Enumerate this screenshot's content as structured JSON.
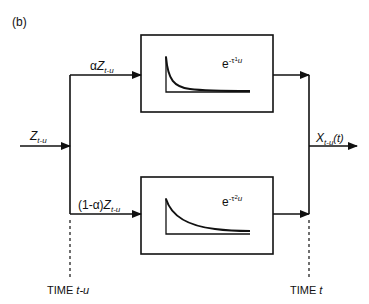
{
  "panel_label": "(b)",
  "input": {
    "symbol": "Z",
    "subscript": "t-u"
  },
  "upper_branch": {
    "coefficient": "α",
    "symbol": "Z",
    "subscript": "t-u"
  },
  "lower_branch": {
    "coefficient": "(1-α)",
    "symbol": "Z",
    "subscript": "t-u"
  },
  "upper_box": {
    "base": "e",
    "exp_prefix": "-τ",
    "exp_index": "1",
    "exp_var": "u",
    "curve": "fast-decay"
  },
  "lower_box": {
    "base": "e",
    "exp_prefix": "-τ",
    "exp_index": "2",
    "exp_var": "u",
    "curve": "slow-decay"
  },
  "output": {
    "symbol": "X",
    "subscript": "t-u",
    "argument": "(t)"
  },
  "time_left": {
    "prefix": "TIME ",
    "value": "t-u"
  },
  "time_right": {
    "prefix": "TIME ",
    "value": "t"
  },
  "colors": {
    "line": "#111111",
    "background": "#ffffff"
  }
}
